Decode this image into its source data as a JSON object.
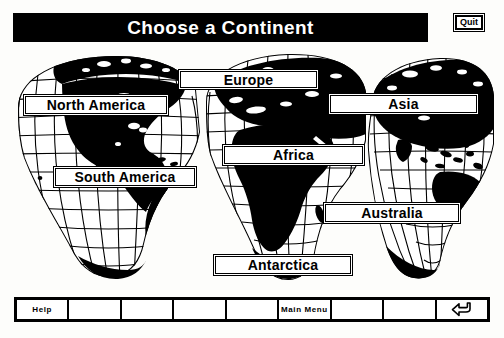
{
  "window": {
    "title": "Choose a Continent",
    "quit_label": "Quit"
  },
  "map": {
    "projection": "interrupted-goode-homolosine",
    "description": "Black-and-white world map with graticule grid, landmasses filled solid black"
  },
  "continents": [
    {
      "id": "north-america",
      "label": "North America"
    },
    {
      "id": "europe",
      "label": "Europe"
    },
    {
      "id": "asia",
      "label": "Asia"
    },
    {
      "id": "africa",
      "label": "Africa"
    },
    {
      "id": "south-america",
      "label": "South America"
    },
    {
      "id": "australia",
      "label": "Australia"
    },
    {
      "id": "antarctica",
      "label": "Antarctica"
    }
  ],
  "toolbar": {
    "cells": [
      {
        "id": "help",
        "label": "Help",
        "type": "text"
      },
      {
        "id": "blank-1",
        "label": "",
        "type": "empty"
      },
      {
        "id": "blank-2",
        "label": "",
        "type": "empty"
      },
      {
        "id": "blank-3",
        "label": "",
        "type": "empty"
      },
      {
        "id": "blank-4",
        "label": "",
        "type": "empty"
      },
      {
        "id": "main-menu",
        "label": "Main Menu",
        "type": "text"
      },
      {
        "id": "blank-5",
        "label": "",
        "type": "empty"
      },
      {
        "id": "blank-6",
        "label": "",
        "type": "empty"
      },
      {
        "id": "enter",
        "label": "",
        "type": "icon",
        "icon": "return-arrow-icon"
      }
    ]
  },
  "colors": {
    "ink": "#000000",
    "paper": "#ffffff",
    "page_background": "#fdfdfb"
  }
}
